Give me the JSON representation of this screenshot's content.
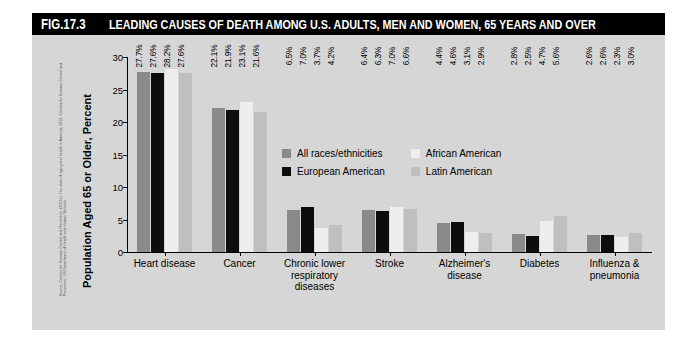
{
  "figure": {
    "number": "FIG.17.3",
    "title": "LEADING CAUSES OF DEATH AMONG U.S. ADULTS, MEN AND WOMEN, 65 YEARS AND OVER",
    "source": "Source: Centers for Disease Control and Prevention. (2013c). The state of aging and health in America, 2013. Centers for Disease Control and Prevention, US Department of Health and Human Services."
  },
  "colors": {
    "title_bar_bg": "#000000",
    "title_bar_text": "#ffffff",
    "panel_bg": "#d6d6d6",
    "all_races": "#8a8a8a",
    "european_american": "#0d0d0d",
    "african_american": "#eeeeee",
    "latin_american": "#bfbfbf",
    "axis": "#000000"
  },
  "chart_data": {
    "type": "bar",
    "title": "LEADING CAUSES OF DEATH AMONG U.S. ADULTS, MEN AND WOMEN, 65 YEARS AND OVER",
    "xlabel": "",
    "ylabel": "Population Aged 65 or Older, Percent",
    "ylim": [
      0,
      30
    ],
    "yticks": [
      0,
      5,
      10,
      15,
      20,
      25,
      30
    ],
    "ytick_labels": [
      "0",
      "5",
      "10",
      "15",
      "20",
      "25",
      "30"
    ],
    "grid": false,
    "legend_position": "inside-upper-right",
    "categories": [
      "Heart disease",
      "Cancer",
      "Chronic lower respiratory diseases",
      "Stroke",
      "Alzheimer's disease",
      "Diabetes",
      "Influenza & pneumonia"
    ],
    "category_lines": [
      [
        "Heart disease"
      ],
      [
        "Cancer"
      ],
      [
        "Chronic lower",
        "respiratory diseases"
      ],
      [
        "Stroke"
      ],
      [
        "Alzheimer's",
        "disease"
      ],
      [
        "Diabetes"
      ],
      [
        "Influenza &",
        "pneumonia"
      ]
    ],
    "series": [
      {
        "name": "All races/ethnicities",
        "color": "#8a8a8a",
        "values": [
          27.7,
          22.1,
          6.5,
          6.4,
          4.4,
          2.8,
          2.6
        ],
        "labels": [
          "27.7%",
          "22.1%",
          "6.5%",
          "6.4%",
          "4.4%",
          "2.8%",
          "2.6%"
        ]
      },
      {
        "name": "European American",
        "color": "#0d0d0d",
        "values": [
          27.6,
          21.9,
          7.0,
          6.3,
          4.6,
          2.5,
          2.6
        ],
        "labels": [
          "27.6%",
          "21.9%",
          "7.0%",
          "6.3%",
          "4.6%",
          "2.5%",
          "2.6%"
        ]
      },
      {
        "name": "African American",
        "color": "#eeeeee",
        "values": [
          28.2,
          23.1,
          3.7,
          7.0,
          3.1,
          4.7,
          2.3
        ],
        "labels": [
          "28.2%",
          "23.1%",
          "3.7%",
          "7.0%",
          "3.1%",
          "4.7%",
          "2.3%"
        ]
      },
      {
        "name": "Latin American",
        "color": "#bfbfbf",
        "values": [
          27.6,
          21.6,
          4.2,
          6.6,
          2.9,
          5.6,
          3.0
        ],
        "labels": [
          "27.6%",
          "21.6%",
          "4.2%",
          "6.6%",
          "2.9%",
          "5.6%",
          "3.0%"
        ]
      }
    ]
  }
}
